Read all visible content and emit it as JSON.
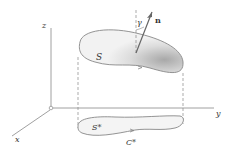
{
  "figure": {
    "axes": {
      "x_label": "x",
      "y_label": "y",
      "z_label": "z"
    },
    "surface_label": "S",
    "projection_label": "S*",
    "boundary_label": "C*",
    "normal_label": "n",
    "angle_label": "γ",
    "colors": {
      "line": "#888888",
      "surface_fill": "#eeeeee",
      "surface_shade": "#b0b0b0",
      "text": "#333333"
    }
  }
}
